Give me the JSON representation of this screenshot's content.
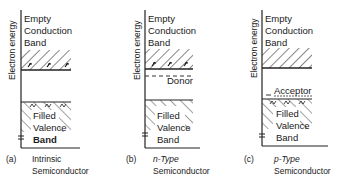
{
  "figure": {
    "axis_label": "Electron energy",
    "panels": [
      {
        "id": "a",
        "caption_letter": "(a)",
        "caption_line1": "Intrinsic",
        "caption_line2": "Semiconductor",
        "conduction_band": [
          "Empty",
          "Conduction",
          "Band"
        ],
        "valence_band": [
          "Filled",
          "Valence",
          "Band"
        ],
        "impurity_level": null
      },
      {
        "id": "b",
        "caption_letter": "(b)",
        "caption_line1": "n-Type",
        "caption_line2": "Semiconductor",
        "conduction_band": [
          "Empty",
          "Conduction",
          "Band"
        ],
        "valence_band": [
          "Filled",
          "Valence",
          "Band"
        ],
        "impurity_level": "Donor"
      },
      {
        "id": "c",
        "caption_letter": "(c)",
        "caption_line1": "p-Type",
        "caption_line2": "Semiconductor",
        "conduction_band": [
          "Empty",
          "Conduction",
          "Band"
        ],
        "valence_band": [
          "Filled",
          "Valence",
          "Band"
        ],
        "impurity_level": "Acceptor"
      }
    ]
  }
}
